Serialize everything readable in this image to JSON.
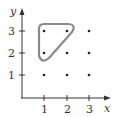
{
  "diagram": {
    "type": "lattice-points-plot",
    "axes": {
      "x_label": "x",
      "y_label": "y",
      "x_ticks": [
        {
          "value": "1",
          "px": 44
        },
        {
          "value": "2",
          "px": 67
        },
        {
          "value": "3",
          "px": 89
        }
      ],
      "y_ticks": [
        {
          "value": "3",
          "px": 31
        },
        {
          "value": "2",
          "px": 53
        },
        {
          "value": "1",
          "px": 75
        }
      ]
    },
    "points": [
      {
        "x": 1,
        "y": 1
      },
      {
        "x": 2,
        "y": 1
      },
      {
        "x": 3,
        "y": 1
      },
      {
        "x": 1,
        "y": 2
      },
      {
        "x": 2,
        "y": 2
      },
      {
        "x": 3,
        "y": 2
      },
      {
        "x": 1,
        "y": 3
      },
      {
        "x": 2,
        "y": 3
      },
      {
        "x": 3,
        "y": 3
      }
    ],
    "enclosed_points": [
      {
        "x": 1,
        "y": 3
      },
      {
        "x": 2,
        "y": 3
      },
      {
        "x": 1,
        "y": 2
      }
    ],
    "colors": {
      "axis": "#333333",
      "point": "#222222",
      "outline": "#8a8a8a"
    }
  }
}
